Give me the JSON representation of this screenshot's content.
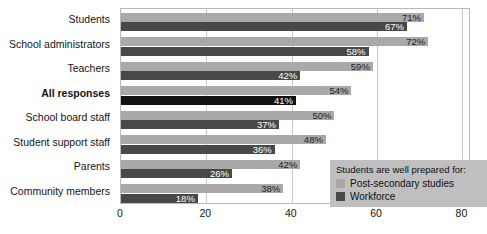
{
  "chart_data": {
    "type": "bar",
    "orientation": "horizontal",
    "title": "",
    "xlabel": "",
    "ylabel": "",
    "xlim": [
      0,
      82
    ],
    "xticks": [
      0,
      20,
      40,
      60,
      80
    ],
    "xtick_labels": [
      "0",
      "20",
      "40",
      "60",
      "80"
    ],
    "grid": true,
    "grid_axis": "x",
    "legend_position": "bottom-right",
    "legend_title": "Students are well prepared for:",
    "categories": [
      "Students",
      "School administrators",
      "Teachers",
      "All responses",
      "School board staff",
      "Student support staff",
      "Parents",
      "Community members"
    ],
    "emphasized_category": "All responses",
    "series": [
      {
        "name": "Post-secondary studies",
        "color": "#a9a9a9",
        "values": [
          71,
          72,
          59,
          54,
          50,
          48,
          42,
          38
        ],
        "labels": [
          "71%",
          "72%",
          "59%",
          "54%",
          "50%",
          "48%",
          "42%",
          "38%"
        ]
      },
      {
        "name": "Workforce",
        "color": "#484848",
        "values": [
          67,
          58,
          42,
          41,
          37,
          36,
          26,
          18
        ],
        "labels": [
          "67%",
          "58%",
          "42%",
          "41%",
          "37%",
          "36%",
          "26%",
          "18%"
        ]
      }
    ]
  },
  "legend": {
    "title": "Students are well prepared for:",
    "items": [
      {
        "label": "Post-secondary studies",
        "swatch": "post"
      },
      {
        "label": "Workforce",
        "swatch": "work"
      }
    ]
  }
}
